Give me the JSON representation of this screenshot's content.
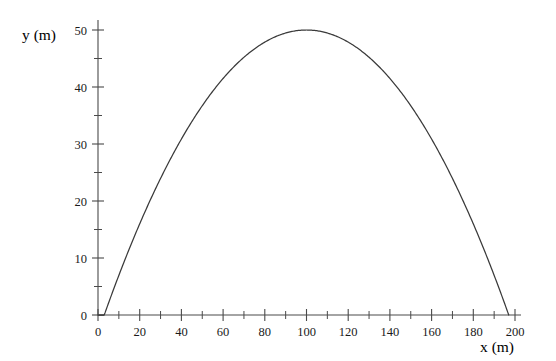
{
  "chart_data": {
    "type": "line",
    "title": "",
    "subtitle": "",
    "xlabel": "x (m)",
    "ylabel": "y (m)",
    "xlim": [
      0,
      200
    ],
    "ylim": [
      0,
      50
    ],
    "grid": false,
    "legend": false,
    "legend_position": "none",
    "x_tick_labels": [
      "0",
      "20",
      "40",
      "60",
      "80",
      "100",
      "120",
      "140",
      "160",
      "180",
      "200"
    ],
    "x_ticks": [
      0,
      20,
      40,
      60,
      80,
      100,
      120,
      140,
      160,
      180,
      200
    ],
    "x_minor_ticks": [
      10,
      30,
      50,
      70,
      90,
      110,
      130,
      150,
      170,
      190
    ],
    "y_tick_labels": [
      "0",
      "10",
      "20",
      "30",
      "40",
      "50"
    ],
    "y_ticks": [
      0,
      10,
      20,
      30,
      40,
      50
    ],
    "y_minor_ticks": [
      5,
      15,
      25,
      35,
      45
    ],
    "series": [
      {
        "name": "trajectory",
        "color": "#3a3a3a",
        "x": [
          0,
          5,
          10,
          15,
          20,
          25,
          30,
          35,
          40,
          45,
          50,
          55,
          60,
          65,
          70,
          75,
          80,
          85,
          90,
          95,
          100,
          105,
          110,
          115,
          120,
          125,
          130,
          135,
          140,
          145,
          150,
          155,
          160,
          165,
          170,
          175,
          180,
          185,
          190,
          195,
          197
        ],
        "y": [
          1.5,
          4.0,
          6.4,
          8.8,
          11.1,
          13.3,
          15.5,
          17.6,
          19.6,
          21.6,
          23.5,
          25.3,
          27.1,
          28.8,
          30.4,
          32.0,
          33.5,
          34.9,
          36.3,
          37.6,
          38.8,
          39.9,
          41.0,
          42.0,
          42.9,
          43.8,
          44.6,
          45.3,
          45.9,
          46.5,
          47.0,
          47.4,
          47.8,
          48.1,
          48.3,
          48.4,
          48.5,
          48.4,
          48.3,
          48.1,
          48.0
        ]
      }
    ],
    "peak": {
      "x": 100,
      "y": 50
    },
    "start_point": {
      "x": 0,
      "y": 1.5
    },
    "end_point": {
      "x": 197,
      "y": 0
    },
    "colors": {
      "line": "#3a3a3a",
      "axis": "#4a4a4a",
      "text": "#1a1a1a",
      "background": "#ffffff"
    }
  }
}
